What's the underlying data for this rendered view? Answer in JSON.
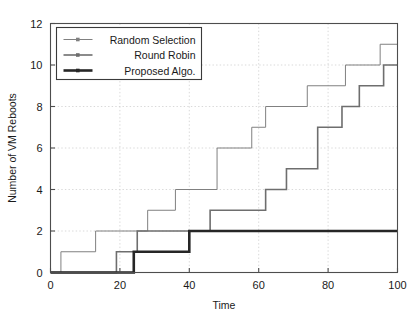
{
  "chart_data": {
    "type": "line",
    "title": "",
    "xlabel": "Time",
    "ylabel": "Number of VM Reboots",
    "xlim": [
      0,
      100
    ],
    "ylim": [
      0,
      12
    ],
    "xticks": [
      0,
      20,
      40,
      60,
      80,
      100
    ],
    "yticks": [
      0,
      2,
      4,
      6,
      8,
      10,
      12
    ],
    "grid": true,
    "legend_position": "top-left",
    "step_style": "post",
    "series": [
      {
        "name": "Random Selection",
        "color": "#808080",
        "line_width": 1.0,
        "marker": "square",
        "x": [
          0,
          3,
          13,
          28,
          36,
          48,
          58,
          62,
          74,
          85,
          95,
          100
        ],
        "y": [
          0,
          1,
          2,
          3,
          4,
          6,
          7,
          8,
          9,
          10,
          11,
          11
        ]
      },
      {
        "name": "Round Robin",
        "color": "#6e6e6e",
        "line_width": 1.6,
        "marker": "square",
        "x": [
          0,
          19,
          25,
          46,
          62,
          68,
          77,
          84,
          89,
          96,
          100
        ],
        "y": [
          0,
          1,
          2,
          3,
          4,
          5,
          7,
          8,
          9,
          10,
          10
        ]
      },
      {
        "name": "Proposed Algo.",
        "color": "#262626",
        "line_width": 2.6,
        "marker": "square",
        "x": [
          0,
          24,
          40,
          100
        ],
        "y": [
          0,
          1,
          2,
          2
        ]
      }
    ]
  },
  "legend": {
    "entries": [
      {
        "label": "Random Selection"
      },
      {
        "label": "Round Robin"
      },
      {
        "label": "Proposed Algo."
      }
    ]
  },
  "axes": {
    "x_tick_labels": [
      "0",
      "20",
      "40",
      "60",
      "80",
      "100"
    ],
    "y_tick_labels": [
      "0",
      "2",
      "4",
      "6",
      "8",
      "10",
      "12"
    ],
    "x_axis_title": "Time",
    "y_axis_title": "Number of VM Reboots"
  }
}
